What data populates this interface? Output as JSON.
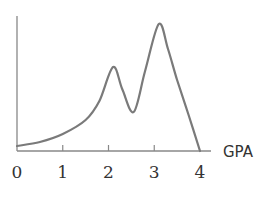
{
  "chart_data": {
    "type": "line",
    "title": "",
    "xlabel": "GPA",
    "ylabel": "",
    "xlim": [
      0,
      4
    ],
    "ylim": [
      0,
      135
    ],
    "grid": false,
    "legend": null,
    "x_ticks": [
      "0",
      "1",
      "2",
      "3",
      "4"
    ],
    "series": [
      {
        "name": "GPA distribution (density curve)",
        "x": [
          0,
          0.5,
          1.0,
          1.5,
          1.8,
          2.1,
          2.3,
          2.55,
          2.8,
          3.1,
          3.3,
          3.5,
          3.75,
          4.0
        ],
        "values": [
          5,
          9,
          17,
          31,
          50,
          84,
          62,
          39,
          80,
          127,
          102,
          71,
          36,
          0
        ]
      }
    ],
    "annotations": [
      "Bimodal distribution with peaks near GPA 2.1 and 3.1"
    ]
  },
  "colors": {
    "curve": "#7a7a7a",
    "axis": "#888888",
    "text": "#333333"
  }
}
